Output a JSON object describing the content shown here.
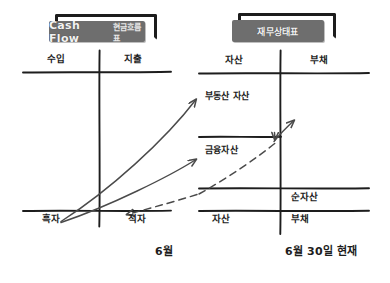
{
  "diagram": {
    "title_left": "Cash Flow",
    "title_left_sub": "현금흐름표",
    "title_right": "재무상태표",
    "left_panel": {
      "header_left": "수입",
      "header_right": "지출",
      "footer_left": "흑자",
      "footer_right": "적자",
      "caption": "6월"
    },
    "right_panel": {
      "header_left": "자산",
      "header_right": "부채",
      "row_net_assets": "순자산",
      "footer_left": "자산",
      "footer_right": "부채",
      "caption": "6월 30일 현재"
    },
    "annotations": {
      "real_estate": "부동산 자산",
      "financial": "금융자산"
    },
    "colors": {
      "ink": "#1d1d1d",
      "arrow": "#4a4a4a",
      "banner_bg": "#6e6e6e",
      "banner_text": "#f2f2f2",
      "paper": "#ffffff"
    }
  }
}
